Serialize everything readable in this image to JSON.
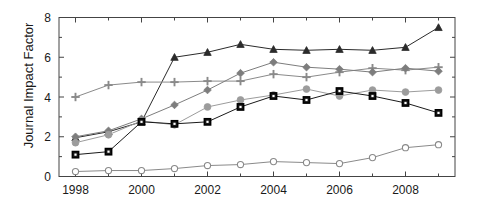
{
  "chart_data": {
    "type": "line",
    "title": "",
    "xlabel": "",
    "ylabel": "Journal Impact Factor",
    "x": [
      1998,
      1999,
      2000,
      2001,
      2002,
      2003,
      2004,
      2005,
      2006,
      2007,
      2008,
      2009
    ],
    "xlim": [
      1997.5,
      2009.5
    ],
    "ylim": [
      0,
      8
    ],
    "xticks_major": [
      1998,
      2000,
      2002,
      2004,
      2006,
      2008
    ],
    "xticks_minor": [
      1999,
      2001,
      2003,
      2005,
      2007,
      2009
    ],
    "xtick_labels": [
      "1998",
      "2000",
      "2002",
      "2004",
      "2006",
      "2008"
    ],
    "yticks_major": [
      0,
      2,
      4,
      6,
      8
    ],
    "yticks_minor": [
      1,
      3,
      5,
      7
    ],
    "ytick_labels": [
      "0",
      "2",
      "4",
      "6",
      "8"
    ],
    "grid": false,
    "legend": "none",
    "series": [
      {
        "name": "series-triangle",
        "marker": "triangle",
        "color": "#2b2b2b",
        "values": [
          1.95,
          2.25,
          2.75,
          6.0,
          6.25,
          6.65,
          6.4,
          6.35,
          6.4,
          6.35,
          6.5,
          7.5
        ]
      },
      {
        "name": "series-plus",
        "marker": "plus",
        "color": "#8a8a8a",
        "values": [
          4.0,
          4.6,
          4.75,
          4.75,
          4.8,
          4.8,
          5.15,
          5.0,
          5.25,
          5.45,
          5.35,
          5.5
        ]
      },
      {
        "name": "series-diamond",
        "marker": "diamond",
        "color": "#7d7d7d",
        "values": [
          2.0,
          2.3,
          2.9,
          3.6,
          4.35,
          5.2,
          5.75,
          5.5,
          5.4,
          5.25,
          5.45,
          5.3
        ]
      },
      {
        "name": "series-circle-filled",
        "marker": "circle-filled",
        "color": "#9c9c9c",
        "values": [
          1.7,
          2.1,
          2.8,
          2.6,
          3.5,
          3.85,
          4.1,
          4.4,
          4.05,
          4.35,
          4.25,
          4.35
        ]
      },
      {
        "name": "series-square",
        "marker": "square",
        "color": "#1a1a1a",
        "values": [
          1.1,
          1.25,
          2.75,
          2.65,
          2.75,
          3.5,
          4.05,
          3.85,
          4.3,
          4.05,
          3.7,
          3.2
        ]
      },
      {
        "name": "series-circle-open",
        "marker": "circle-open",
        "color": "#8a8a8a",
        "values": [
          0.25,
          0.3,
          0.3,
          0.4,
          0.55,
          0.6,
          0.75,
          0.7,
          0.65,
          0.95,
          1.45,
          1.6
        ]
      }
    ]
  }
}
